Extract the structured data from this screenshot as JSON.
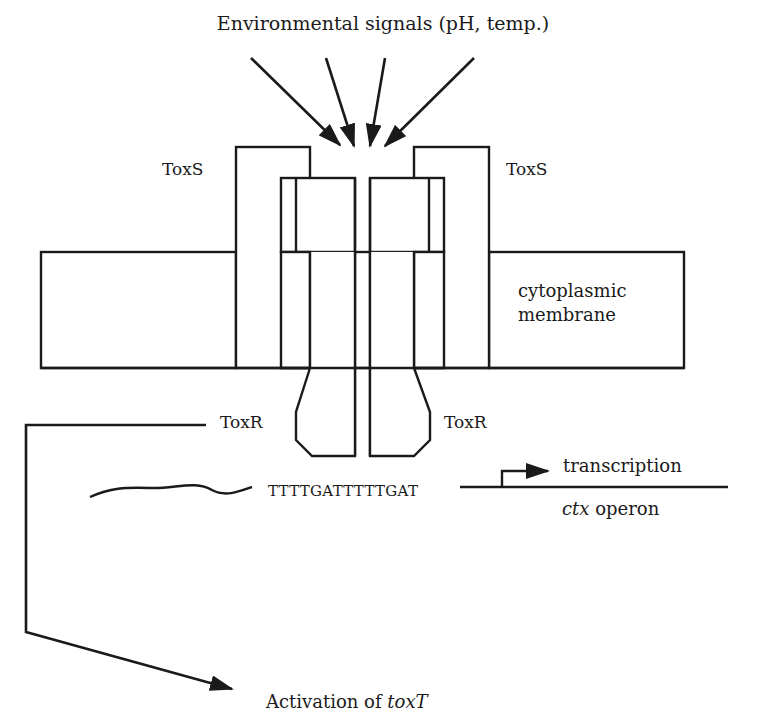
{
  "title": "Environmental signals (pH, temp.)",
  "labels": {
    "toxs_left": "ToxS",
    "toxs_right": "ToxS",
    "toxr_left": "ToxR",
    "toxr_right": "ToxR",
    "membrane_line1": "cytoplasmic",
    "membrane_line2": "membrane",
    "promoter_sequence": "TTTTGATTTTTGAT",
    "transcription": "transcription",
    "operon_italic": "ctx",
    "operon_rest": " operon",
    "activation_prefix": "Activation of ",
    "activation_gene": "toxT"
  },
  "colors": {
    "ink": "#1a1a1a",
    "background": "#ffffff"
  },
  "signal_arrows": 4
}
